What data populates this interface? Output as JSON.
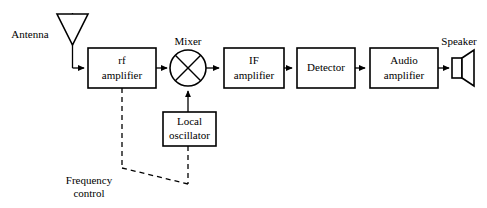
{
  "diagram": {
    "stroke_color": "#000000",
    "background_color": "#ffffff",
    "blocks": [
      {
        "id": "rf_amplifier",
        "line1": "rf",
        "line2": "amplifier",
        "x": 88,
        "y": 48,
        "w": 68,
        "h": 40
      },
      {
        "id": "if_amplifier",
        "line1": "IF",
        "line2": "amplifier",
        "x": 224,
        "y": 48,
        "w": 60,
        "h": 40
      },
      {
        "id": "detector",
        "line1": "Detector",
        "line2": "",
        "x": 297,
        "y": 48,
        "w": 58,
        "h": 40
      },
      {
        "id": "audio_amplifier",
        "line1": "Audio",
        "line2": "amplifier",
        "x": 370,
        "y": 48,
        "w": 68,
        "h": 40
      },
      {
        "id": "local_oscillator",
        "line1": "Local",
        "line2": "oscillator",
        "x": 163,
        "y": 112,
        "w": 53,
        "h": 34
      }
    ],
    "free_labels": [
      {
        "id": "antenna_label",
        "text": "Antenna",
        "x": 30,
        "y": 35
      },
      {
        "id": "mixer_label",
        "text": "Mixer",
        "x": 188,
        "y": 42
      },
      {
        "id": "speaker_label",
        "text": "Speaker",
        "x": 459,
        "y": 42
      },
      {
        "id": "freq_ctrl_line1",
        "text": "Frequency",
        "x": 89,
        "y": 181
      },
      {
        "id": "freq_ctrl_line2",
        "text": "control",
        "x": 89,
        "y": 194
      }
    ],
    "symbols": {
      "antenna": {
        "label": "antenna-symbol"
      },
      "mixer": {
        "label": "mixer-symbol"
      },
      "speaker": {
        "label": "speaker-symbol"
      }
    },
    "signal_flow": [
      "antenna",
      "rf amplifier",
      "mixer",
      "IF amplifier",
      "detector",
      "audio amplifier",
      "speaker"
    ],
    "control_flow": [
      "frequency control to rf amplifier",
      "frequency control to local oscillator"
    ],
    "oscillator_feed": "local oscillator to mixer"
  }
}
